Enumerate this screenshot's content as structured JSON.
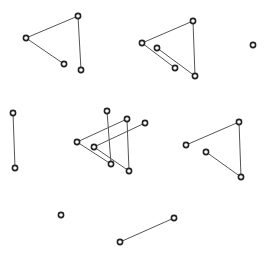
{
  "diagram": {
    "width": 271,
    "height": 256,
    "background": "#ffffff",
    "edge_color": "#555555",
    "node_stroke": "#222222",
    "node_radius": 2.6,
    "groups": [
      {
        "name": "group-top-left",
        "nodes": [
          [
            26,
            38
          ],
          [
            78,
            16
          ],
          [
            64,
            64
          ],
          [
            81,
            70
          ]
        ],
        "edges": [
          [
            0,
            1
          ],
          [
            0,
            2
          ],
          [
            1,
            3
          ]
        ]
      },
      {
        "name": "group-top-middle",
        "nodes": [
          [
            142,
            43
          ],
          [
            193,
            21
          ],
          [
            157,
            48
          ],
          [
            175,
            68
          ],
          [
            195,
            76
          ]
        ],
        "edges": [
          [
            0,
            1
          ],
          [
            0,
            3
          ],
          [
            1,
            4
          ],
          [
            2,
            4
          ]
        ]
      },
      {
        "name": "group-isolated-top-right",
        "nodes": [
          [
            253,
            45
          ]
        ],
        "edges": []
      },
      {
        "name": "group-left-vertical",
        "nodes": [
          [
            13,
            113
          ],
          [
            15,
            168
          ]
        ],
        "edges": [
          [
            0,
            1
          ]
        ]
      },
      {
        "name": "group-center-overlap",
        "nodes": [
          [
            77,
            142
          ],
          [
            107,
            111
          ],
          [
            127,
            119
          ],
          [
            145,
            123
          ],
          [
            94,
            147
          ],
          [
            111,
            164
          ],
          [
            129,
            171
          ]
        ],
        "edges": [
          [
            0,
            2
          ],
          [
            0,
            5
          ],
          [
            1,
            5
          ],
          [
            2,
            6
          ],
          [
            4,
            3
          ],
          [
            4,
            6
          ]
        ]
      },
      {
        "name": "group-right",
        "nodes": [
          [
            186,
            145
          ],
          [
            239,
            122
          ],
          [
            206,
            152
          ],
          [
            241,
            177
          ]
        ],
        "edges": [
          [
            0,
            1
          ],
          [
            1,
            3
          ],
          [
            2,
            3
          ]
        ]
      },
      {
        "name": "group-isolated-bottom-left",
        "nodes": [
          [
            61,
            215
          ]
        ],
        "edges": []
      },
      {
        "name": "group-bottom-line",
        "nodes": [
          [
            120,
            242
          ],
          [
            174,
            218
          ]
        ],
        "edges": [
          [
            0,
            1
          ]
        ]
      }
    ]
  }
}
